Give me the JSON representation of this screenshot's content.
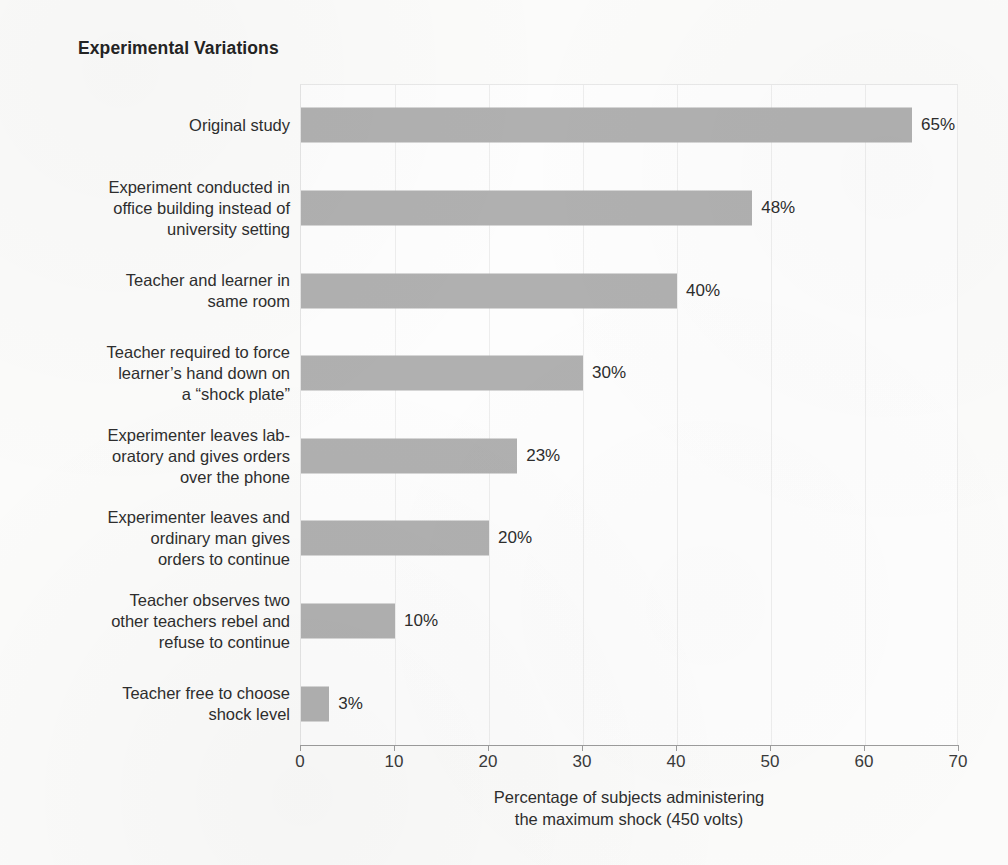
{
  "title": "Experimental Variations",
  "axis": {
    "x_ticks": [
      0,
      10,
      20,
      30,
      40,
      50,
      60,
      70
    ],
    "caption_line1": "Percentage of subjects administering",
    "caption_line2": "the maximum shock (450 volts)"
  },
  "colors": {
    "bar": "#b0b0b0",
    "background": "#fbfbfa",
    "plot_background": "#fdfdfd",
    "gridline": "#ededed",
    "axis": "#9c9c9c",
    "text": "#2b2b2b"
  },
  "rows": [
    {
      "label": "Original study",
      "value": 65,
      "value_label": "65%"
    },
    {
      "label": "Experiment conducted in\noffice building instead of\nuniversity setting",
      "value": 48,
      "value_label": "48%"
    },
    {
      "label": "Teacher and learner in\nsame room",
      "value": 40,
      "value_label": "40%"
    },
    {
      "label": "Teacher required to force\nlearner’s hand down on\na “shock plate”",
      "value": 30,
      "value_label": "30%"
    },
    {
      "label": "Experimenter leaves lab-\noratory and gives orders\nover the phone",
      "value": 23,
      "value_label": "23%"
    },
    {
      "label": "Experimenter leaves and\nordinary man gives\norders to continue",
      "value": 20,
      "value_label": "20%"
    },
    {
      "label": "Teacher observes two\nother teachers rebel and\nrefuse to continue",
      "value": 10,
      "value_label": "10%"
    },
    {
      "label": "Teacher free to choose\nshock level",
      "value": 3,
      "value_label": "3%"
    }
  ],
  "chart_data": {
    "type": "bar",
    "orientation": "horizontal",
    "title": "Experimental Variations",
    "xlabel": "Percentage of subjects administering the maximum shock (450 volts)",
    "ylabel": "",
    "xlim": [
      0,
      70
    ],
    "xticks": [
      0,
      10,
      20,
      30,
      40,
      50,
      60,
      70
    ],
    "grid": true,
    "legend": null,
    "categories": [
      "Original study",
      "Experiment conducted in office building instead of university setting",
      "Teacher and learner in same room",
      "Teacher required to force learner’s hand down on a “shock plate”",
      "Experimenter leaves laboratory and gives orders over the phone",
      "Experimenter leaves and ordinary man gives orders to continue",
      "Teacher observes two other teachers rebel and refuse to continue",
      "Teacher free to choose shock level"
    ],
    "values": [
      65,
      48,
      40,
      30,
      23,
      20,
      10,
      3
    ],
    "data_labels": [
      "65%",
      "48%",
      "40%",
      "30%",
      "23%",
      "20%",
      "10%",
      "3%"
    ],
    "units": "percent"
  }
}
